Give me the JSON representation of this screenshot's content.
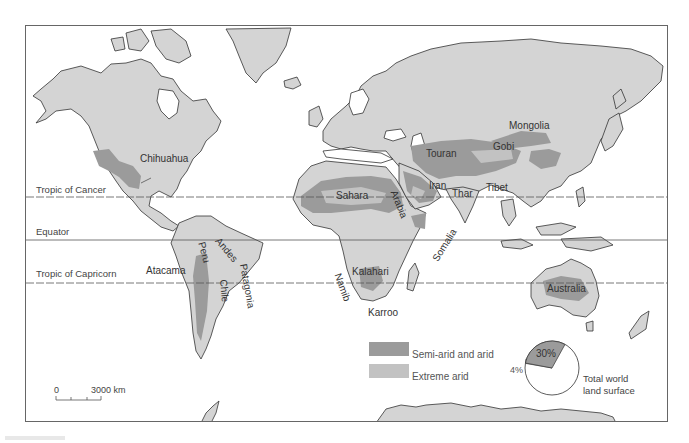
{
  "map": {
    "title": "World arid lands",
    "colors": {
      "land": "#d4d4d4",
      "semi_arid": "#9b9b9b",
      "extreme_arid": "#c2c2c2",
      "ocean": "#ffffff",
      "coast": "#333333"
    },
    "reference_lines": [
      {
        "label": "Tropic of Cancer",
        "style": "dashed"
      },
      {
        "label": "Equator",
        "style": "solid"
      },
      {
        "label": "Tropic of Capricorn",
        "style": "dashed"
      }
    ],
    "regions": [
      {
        "label": "Chihuahua"
      },
      {
        "label": "Sahara"
      },
      {
        "label": "Arabia"
      },
      {
        "label": "Iran"
      },
      {
        "label": "Thar"
      },
      {
        "label": "Tibet"
      },
      {
        "label": "Touran"
      },
      {
        "label": "Gobi"
      },
      {
        "label": "Mongolia"
      },
      {
        "label": "Somalia"
      },
      {
        "label": "Kalahari"
      },
      {
        "label": "Namib"
      },
      {
        "label": "Karroo"
      },
      {
        "label": "Australia"
      },
      {
        "label": "Atacama"
      },
      {
        "label": "Peru"
      },
      {
        "label": "Chile"
      },
      {
        "label": "Andes"
      },
      {
        "label": "Patagonia"
      }
    ],
    "legend": {
      "items": [
        {
          "label": "Semi-arid and arid",
          "color": "#9b9b9b"
        },
        {
          "label": "Extreme arid",
          "color": "#c2c2c2"
        }
      ]
    },
    "pie": {
      "caption_line1": "Total world",
      "caption_line2": "land surface",
      "slices": [
        {
          "label": "30%",
          "value": 30,
          "color": "#9b9b9b"
        },
        {
          "label": "4%",
          "value": 4,
          "color": "#c2c2c2"
        },
        {
          "label": "",
          "value": 66,
          "color": "#ffffff"
        }
      ]
    },
    "scale_bar": {
      "start": "0",
      "end": "3000 km"
    }
  }
}
